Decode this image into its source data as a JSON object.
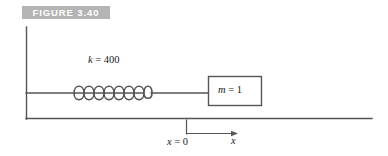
{
  "figure": {
    "banner_label": "FIGURE 3.40",
    "banner_color": "#b4b4b4",
    "banner_text_color": "#ffffff",
    "background_color": "#ffffff",
    "line_color": "#555555",
    "text_color": "#1a1a1a",
    "width": 388,
    "height": 156
  },
  "diagram": {
    "type": "spring-mass-system",
    "title": "FIGURE 3.40",
    "labels": {
      "spring_constant": {
        "symbol": "k",
        "equals": "=",
        "value": "400",
        "full_text": "k = 400"
      },
      "mass": {
        "symbol": "m",
        "equals": "=",
        "value": "1",
        "full_text": "m = 1"
      },
      "origin": {
        "symbol": "x",
        "equals": "=",
        "value": "0",
        "full_text": "x = 0"
      },
      "axis": {
        "symbol": "x",
        "full_text": "x"
      }
    },
    "elements": {
      "wall": {
        "name": "wall",
        "x": 26,
        "y_top": 27,
        "y_bottom": 119
      },
      "ground": {
        "name": "ground-line",
        "x_start": 26,
        "x_end": 372,
        "y": 118
      },
      "spring_rod_left": {
        "x_start": 26,
        "x_end": 73,
        "y": 93
      },
      "spring": {
        "x_start": 73,
        "x_end": 152,
        "y": 93,
        "coils": 8,
        "amplitude": 11
      },
      "spring_rod_right": {
        "x_start": 152,
        "x_end": 208,
        "y": 93
      },
      "mass_block": {
        "x": 208,
        "y": 76,
        "width": 54,
        "height": 30
      },
      "origin_tick": {
        "x": 186,
        "y_top": 120,
        "y_bottom": 134
      },
      "x_arrow": {
        "x_start": 186,
        "x_end": 238,
        "y": 134,
        "direction": "right"
      }
    }
  }
}
